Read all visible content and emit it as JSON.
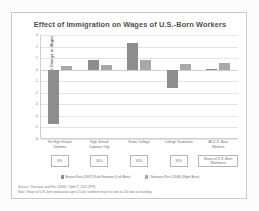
{
  "chart_data": {
    "type": "bar",
    "title": "Effect of Immigration on Wages of U.S.-Born Workers",
    "xlabel": "",
    "ylabel": "Percent Change in Wages",
    "ylim": [
      -6,
      3
    ],
    "grid": true,
    "legend_position": "bottom",
    "categories": [
      "No High School\nDiploma",
      "High School\nDiploma Only",
      "Some College",
      "College Graduates",
      "All U.S.-Born\nWorkers"
    ],
    "yticks": [
      "3",
      "2",
      "1",
      "0",
      "-1",
      "-2",
      "-3",
      "-4",
      "-5",
      "-6"
    ],
    "series": [
      {
        "name": "Borjas-Katz (2007) Rule Estimate (Left Bars)",
        "color": "#8d8d8d",
        "values": [
          -4.7,
          0.8,
          2.3,
          -1.6,
          0.05
        ]
      },
      {
        "name": "Ottaviano-Peri (2006) (Right Bars)",
        "color": "#a8a8a8",
        "values": [
          0.3,
          0.4,
          0.85,
          0.5,
          0.6
        ]
      }
    ],
    "share_boxes": [
      "8%",
      "30%",
      "30%",
      "33%",
      "Share of U.S.-Born\nWorkforce"
    ],
    "notes": [
      "Source: Ottaviano and Peri (2006), Table 7, 2011 (IPR).",
      "Note: Share of U.S.-born population ages 25-64; numbers may not sum to 100 due to rounding."
    ]
  }
}
